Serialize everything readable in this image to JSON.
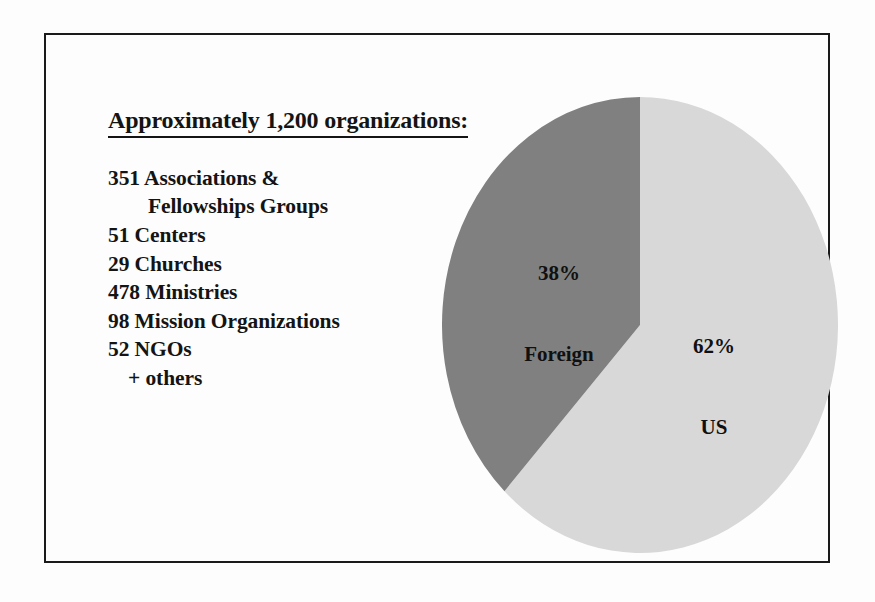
{
  "frame": {
    "border_color": "#1a1a1a"
  },
  "text_block": {
    "heading": "Approximately 1,200 organizations:",
    "items": [
      {
        "text": "351 Associations &",
        "indent": 0
      },
      {
        "text": "Fellowships Groups",
        "indent": 1
      },
      {
        "text": "51 Centers",
        "indent": 0
      },
      {
        "text": "29 Churches",
        "indent": 0
      },
      {
        "text": "478 Ministries",
        "indent": 0
      },
      {
        "text": "98 Mission Organizations",
        "indent": 0
      },
      {
        "text": "52 NGOs",
        "indent": 0
      },
      {
        "text": "+ others",
        "indent": 2
      }
    ]
  },
  "chart_data": {
    "type": "pie",
    "title": "",
    "categories": [
      "US",
      "Foreign"
    ],
    "values": [
      62,
      38
    ],
    "value_unit": "%",
    "total_label": "Approximately 1,200 organizations:",
    "slices": [
      {
        "name": "US",
        "value": 62,
        "percent_label": "62%",
        "name_label": "US",
        "color": "#d8d8d8",
        "start_angle_deg": 0,
        "sweep_deg": 223.2,
        "direction": "clockwise"
      },
      {
        "name": "Foreign",
        "value": 38,
        "percent_label": "38%",
        "name_label": "Foreign",
        "color": "#808080",
        "start_angle_deg": 0,
        "sweep_deg": 136.8,
        "direction": "counterclockwise"
      }
    ],
    "legend": "none",
    "labels_inside": true,
    "grid": false,
    "xlabel": "",
    "ylabel": ""
  }
}
